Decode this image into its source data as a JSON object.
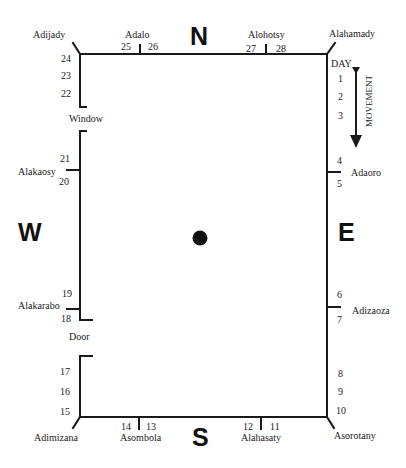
{
  "directions": {
    "north": "N",
    "south": "S",
    "east": "E",
    "west": "W"
  },
  "corners": {
    "top_left": "Adijady",
    "top_right": "Alahamady",
    "bottom_left": "Adimizana",
    "bottom_right": "Asorotany"
  },
  "wall_markers": {
    "north_left": "Adalo",
    "north_right": "Alohotsy",
    "east_upper": "Adaoro",
    "east_lower": "Adizaoza",
    "south_right": "Alahasaty",
    "south_left": "Asombola",
    "west_lower": "Alakarabo",
    "west_upper": "Alakaosy"
  },
  "openings": {
    "window": "Window",
    "door": "Door"
  },
  "legend": {
    "day_label": "DAY",
    "movement_label": "MOVEMENT"
  },
  "day_numbers": {
    "d1": "1",
    "d2": "2",
    "d3": "3",
    "d4": "4",
    "d5": "5",
    "d6": "6",
    "d7": "7",
    "d8": "8",
    "d9": "9",
    "d10": "10",
    "d11": "11",
    "d12": "12",
    "d13": "13",
    "d14": "14",
    "d15": "15",
    "d16": "16",
    "d17": "17",
    "d18": "18",
    "d19": "19",
    "d20": "20",
    "d21": "21",
    "d22": "22",
    "d23": "23",
    "d24": "24",
    "d25": "25",
    "d26": "26",
    "d27": "27",
    "d28": "28"
  },
  "colors": {
    "ink": "#1a1a1a",
    "background": "#ffffff"
  }
}
